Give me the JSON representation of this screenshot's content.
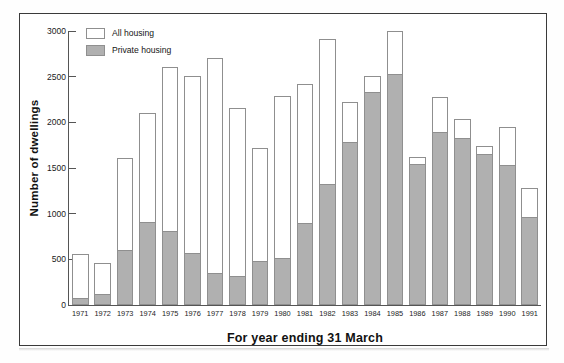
{
  "chart_data": {
    "type": "bar",
    "title": "",
    "xlabel": "For year ending 31 March",
    "ylabel": "Number of dwellings",
    "ylim": [
      0,
      3000
    ],
    "yticks": [
      0,
      500,
      1000,
      1500,
      2000,
      2500,
      3000
    ],
    "ytick_labels": [
      "0",
      "500",
      "1000",
      "1500",
      "2000",
      "2500",
      "3000"
    ],
    "grid": false,
    "legend_position": "top-left",
    "stacked_overlay": true,
    "categories": [
      "1971",
      "1972",
      "1973",
      "1974",
      "1975",
      "1976",
      "1977",
      "1978",
      "1979",
      "1980",
      "1981",
      "1982",
      "1983",
      "1984",
      "1985",
      "1986",
      "1987",
      "1988",
      "1989",
      "1990",
      "1991"
    ],
    "series": [
      {
        "name": "All housing",
        "fill": "#ffffff",
        "values": [
          560,
          465,
          1610,
          2105,
          2605,
          2505,
          2705,
          2160,
          1715,
          2285,
          2420,
          2915,
          2225,
          2510,
          2995,
          1625,
          2280,
          2035,
          1745,
          1950,
          1285
        ]
      },
      {
        "name": "Private housing",
        "fill": "#b0b0b0",
        "values": [
          80,
          125,
          605,
          910,
          805,
          570,
          350,
          320,
          480,
          520,
          900,
          1325,
          1790,
          2330,
          2530,
          1540,
          1890,
          1830,
          1650,
          1535,
          960
        ]
      }
    ]
  },
  "legend": {
    "items": [
      {
        "label": "All housing",
        "swatch": "white"
      },
      {
        "label": "Private housing",
        "swatch": "gray"
      }
    ]
  },
  "colors": {
    "private_fill": "#b0b0b0",
    "all_fill": "#ffffff",
    "bar_edge": "#8f8f8f",
    "axis": "#555555",
    "frame": "#3a3a3a",
    "text": "#111111"
  }
}
